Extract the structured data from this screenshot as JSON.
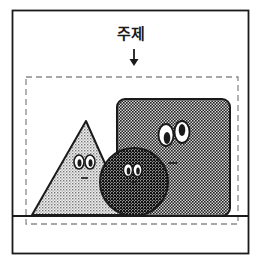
{
  "diagram": {
    "subject_label": "주제",
    "arrow_glyph": "↓",
    "colors": {
      "ink": "#1a1a1a",
      "dashed": "#8a8a8a",
      "background": "#ffffff",
      "triangle_fill": "#d8d8d8",
      "square_fill": "#9a9a9a",
      "circle_fill": "#6a6a6a"
    },
    "elements": [
      {
        "name": "outer-frame",
        "shape": "rectangle"
      },
      {
        "name": "subject-dashed-frame",
        "shape": "dashed-rectangle"
      },
      {
        "name": "ground-line",
        "shape": "line"
      },
      {
        "name": "triangle-character",
        "shape": "triangle",
        "face": "eyes-and-mouth"
      },
      {
        "name": "square-character",
        "shape": "rounded-square",
        "face": "eyes-and-mouth"
      },
      {
        "name": "circle-character",
        "shape": "circle",
        "face": "eyes-and-mouth"
      }
    ]
  }
}
